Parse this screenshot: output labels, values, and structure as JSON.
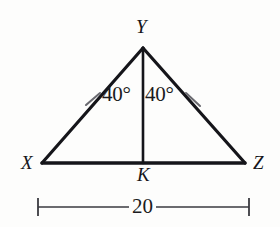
{
  "figure": {
    "type": "geometry-diagram",
    "background_color": "#fdfdfc",
    "stroke_color": "#15151a",
    "tick_color": "#6a6a70"
  },
  "vertices": {
    "apex": {
      "name": "Y",
      "x": 143,
      "y": 48
    },
    "left": {
      "name": "X",
      "x": 42,
      "y": 163
    },
    "right": {
      "name": "Z",
      "x": 245,
      "y": 163
    },
    "foot": {
      "name": "K",
      "x": 143,
      "y": 163
    }
  },
  "labels": {
    "apex_label": "Y",
    "left_label": "X",
    "right_label": "Z",
    "foot_label": "K"
  },
  "angles": {
    "left_angle": "40°",
    "right_angle": "40°"
  },
  "tick_marks": {
    "count": 2,
    "left": {
      "x": 93,
      "y": 99
    },
    "right": {
      "x": 193,
      "y": 99
    },
    "meaning": "congruent-sides"
  },
  "dimension": {
    "value": "20",
    "start_x": 38,
    "end_x": 249,
    "y": 207,
    "measures": "XZ"
  }
}
